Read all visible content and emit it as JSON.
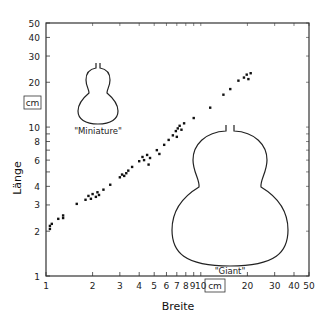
{
  "chart_data": {
    "type": "scatter",
    "title": "",
    "xlabel": "Breite",
    "ylabel": "Länge",
    "x_unit": "cm",
    "y_unit": "cm",
    "xscale": "log",
    "yscale": "log",
    "xlim": [
      1,
      50
    ],
    "ylim": [
      1,
      50
    ],
    "grid": false,
    "legend": null,
    "x_ticks": [
      1,
      2,
      3,
      4,
      5,
      6,
      7,
      8,
      9,
      10,
      20,
      30,
      40,
      50
    ],
    "x_tick_labels": [
      "1",
      "2",
      "3",
      "4",
      "5",
      "6",
      "7",
      "8",
      "9",
      "10",
      "20",
      "30",
      "40",
      "50"
    ],
    "y_ticks": [
      1,
      2,
      3,
      4,
      6,
      8,
      10,
      20,
      30,
      40,
      50
    ],
    "y_tick_labels": [
      "1",
      "2",
      "3",
      "4",
      "6",
      "8",
      "10",
      "20",
      "30",
      "40",
      "50"
    ],
    "annotations": [
      {
        "text": "\"Miniature\"",
        "shape": "small gourd outline",
        "position": "upper-left"
      },
      {
        "text": "\"Giant\"",
        "shape": "large gourd outline",
        "position": "lower-right"
      }
    ],
    "series": [
      {
        "name": "gourds",
        "points": [
          {
            "x": 1.06,
            "y": 2.07
          },
          {
            "x": 1.06,
            "y": 2.17
          },
          {
            "x": 1.09,
            "y": 2.24
          },
          {
            "x": 1.2,
            "y": 2.42
          },
          {
            "x": 1.29,
            "y": 2.45
          },
          {
            "x": 1.29,
            "y": 2.55
          },
          {
            "x": 1.58,
            "y": 3.05
          },
          {
            "x": 1.8,
            "y": 3.25
          },
          {
            "x": 1.88,
            "y": 3.45
          },
          {
            "x": 1.95,
            "y": 3.3
          },
          {
            "x": 2.0,
            "y": 3.55
          },
          {
            "x": 2.1,
            "y": 3.4
          },
          {
            "x": 2.15,
            "y": 3.65
          },
          {
            "x": 2.2,
            "y": 3.5
          },
          {
            "x": 2.35,
            "y": 3.8
          },
          {
            "x": 2.6,
            "y": 4.1
          },
          {
            "x": 3.0,
            "y": 4.6
          },
          {
            "x": 3.1,
            "y": 4.8
          },
          {
            "x": 3.2,
            "y": 4.7
          },
          {
            "x": 3.3,
            "y": 4.9
          },
          {
            "x": 3.4,
            "y": 5.1
          },
          {
            "x": 3.6,
            "y": 5.4
          },
          {
            "x": 4.0,
            "y": 5.9
          },
          {
            "x": 4.2,
            "y": 6.3
          },
          {
            "x": 4.3,
            "y": 6.0
          },
          {
            "x": 4.5,
            "y": 6.5
          },
          {
            "x": 4.7,
            "y": 6.2
          },
          {
            "x": 4.6,
            "y": 5.6
          },
          {
            "x": 5.2,
            "y": 7.0
          },
          {
            "x": 5.4,
            "y": 6.6
          },
          {
            "x": 5.8,
            "y": 7.6
          },
          {
            "x": 6.2,
            "y": 8.2
          },
          {
            "x": 6.6,
            "y": 8.8
          },
          {
            "x": 6.9,
            "y": 9.4
          },
          {
            "x": 7.1,
            "y": 9.8
          },
          {
            "x": 7.3,
            "y": 10.2
          },
          {
            "x": 7.5,
            "y": 9.6
          },
          {
            "x": 7.8,
            "y": 10.6
          },
          {
            "x": 7.0,
            "y": 8.6
          },
          {
            "x": 9.0,
            "y": 11.5
          },
          {
            "x": 11.5,
            "y": 13.5
          },
          {
            "x": 14.0,
            "y": 16.5
          },
          {
            "x": 15.5,
            "y": 18.0
          },
          {
            "x": 17.5,
            "y": 20.5
          },
          {
            "x": 19.0,
            "y": 21.5
          },
          {
            "x": 19.8,
            "y": 22.5
          },
          {
            "x": 21.0,
            "y": 23.0
          },
          {
            "x": 20.3,
            "y": 21.0
          }
        ]
      }
    ]
  }
}
